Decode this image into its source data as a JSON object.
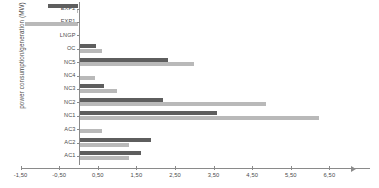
{
  "chart_data": {
    "type": "bar",
    "orientation": "horizontal",
    "title": "",
    "xlabel": "",
    "ylabel": "power consumption/generation (MW)",
    "xlim": [
      -1.9,
      6.95
    ],
    "ylim": null,
    "grid": false,
    "legend": null,
    "decimal_separator": ",",
    "zero_reference": 0,
    "categories": [
      "EXP2",
      "EXP1",
      "LNGP",
      "OC",
      "NC5",
      "NC4",
      "NC3",
      "NC2",
      "NC1",
      "AC3",
      "AC2",
      "AC1"
    ],
    "xticks": [
      -1.5,
      -0.5,
      0.5,
      1.5,
      2.5,
      3.5,
      4.5,
      5.5,
      6.5
    ],
    "xticklabels": [
      "-1,50",
      "-0,50",
      "0,50",
      "1,50",
      "2,50",
      "3,50",
      "4,50",
      "5,50",
      "6,50"
    ],
    "series": [
      {
        "name": "series-dark",
        "color": "#5e5e5e",
        "values": [
          -0.78,
          0.0,
          0.05,
          0.45,
          2.32,
          0.0,
          0.65,
          2.18,
          3.6,
          0.0,
          1.87,
          1.62
        ]
      },
      {
        "name": "series-light",
        "color": "#b9b9b9",
        "values": [
          -0.05,
          -1.38,
          0.04,
          0.6,
          3.0,
          0.43,
          1.0,
          4.85,
          6.22,
          0.6,
          1.32,
          1.3
        ]
      }
    ]
  },
  "axis": {
    "y_title": "power consumption/generation (MW)",
    "x_tick_labels": [
      "-1,50",
      "-0,50",
      "0,50",
      "1,50",
      "2,50",
      "3,50",
      "4,50",
      "5,50",
      "6,50"
    ],
    "category_labels": [
      "EXP2",
      "EXP1",
      "LNGP",
      "OC",
      "NC5",
      "NC4",
      "NC3",
      "NC2",
      "NC1",
      "AC3",
      "AC2",
      "AC1"
    ]
  }
}
